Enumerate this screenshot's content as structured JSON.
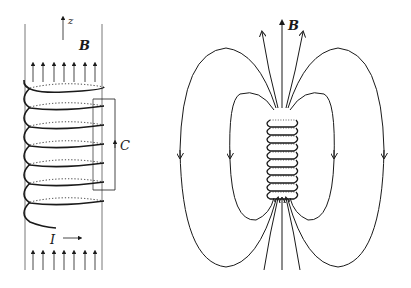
{
  "figure": {
    "left_panel": {
      "description": "Long solenoid with uniform interior field and rectangular Amperian loop",
      "labels": {
        "axis": "z",
        "field": "B",
        "loop": "C",
        "current": "I"
      },
      "turns": 7,
      "field_arrows_top": 7,
      "field_arrows_bottom": 7
    },
    "right_panel": {
      "description": "Short solenoid with dipole-like magnetic field lines",
      "labels": {
        "field": "B"
      },
      "turns": 10,
      "field_lines_top": 5,
      "field_lines_bottom": 5
    }
  },
  "colors": {
    "ink": "#1a1a1a",
    "guide_lines": "#555555",
    "background": "#ffffff"
  }
}
